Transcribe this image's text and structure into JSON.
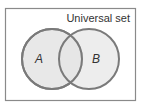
{
  "diagram": {
    "type": "venn",
    "universal_set_label": "Universal set",
    "sets": [
      {
        "label": "A",
        "cx": 52,
        "cy": 59,
        "r": 30
      },
      {
        "label": "B",
        "cx": 89,
        "cy": 59,
        "r": 30
      }
    ],
    "colors": {
      "border": "#7a7a7a",
      "fill": "#e6e6e6",
      "frame": "#8a8a8a",
      "text": "#333333"
    }
  }
}
